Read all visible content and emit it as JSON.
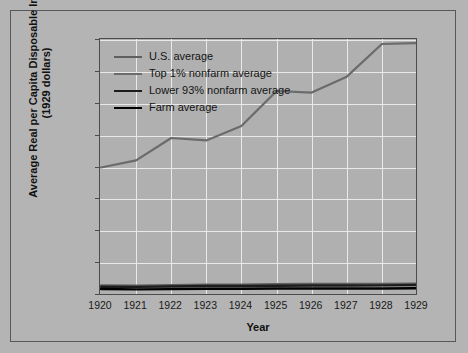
{
  "chart_data": {
    "type": "line",
    "title": "",
    "xlabel": "Year",
    "ylabel": "Average Real per Capita Disposable Income (1929 dollars)",
    "x": [
      1920,
      1921,
      1922,
      1923,
      1924,
      1925,
      1926,
      1927,
      1928,
      1929
    ],
    "xlim": [
      1920,
      1929
    ],
    "ylim": [
      0,
      16000
    ],
    "yticks": [
      0,
      2000,
      4000,
      6000,
      8000,
      10000,
      12000,
      14000,
      16000
    ],
    "ytick_labels": [
      "0",
      "2,000",
      "4,000",
      "6,000",
      "8,000",
      "10,000",
      "12,000",
      "14,000",
      "16,000"
    ],
    "xtick_labels": [
      "1920",
      "1921",
      "1922",
      "1923",
      "1924",
      "1925",
      "1926",
      "1927",
      "1928",
      "1929"
    ],
    "grid": true,
    "legend_position": "upper left",
    "series": [
      {
        "name": "U.S. average",
        "color": "#5f5f5f",
        "width": 2.0,
        "values": [
          610,
          600,
          625,
          660,
          665,
          690,
          700,
          700,
          705,
          720
        ]
      },
      {
        "name": "Top 1% nonfarm average",
        "color": "#6b6b6b",
        "width": 2.2,
        "values": [
          8000,
          8450,
          9850,
          9700,
          10600,
          12800,
          12700,
          13700,
          15750,
          15800
        ]
      },
      {
        "name": "Lower 93% nonfarm average",
        "color": "#1c1c1c",
        "width": 2.4,
        "values": [
          520,
          510,
          535,
          560,
          565,
          585,
          595,
          600,
          605,
          625
        ]
      },
      {
        "name": "Farm average",
        "color": "#000000",
        "width": 2.4,
        "values": [
          380,
          350,
          370,
          395,
          390,
          410,
          405,
          405,
          410,
          420
        ]
      }
    ]
  },
  "axis": {
    "x_title": "Year",
    "y_title_line1": "Average Real per Capita Disposable Income",
    "y_title_line2": "(1929 dollars)"
  }
}
